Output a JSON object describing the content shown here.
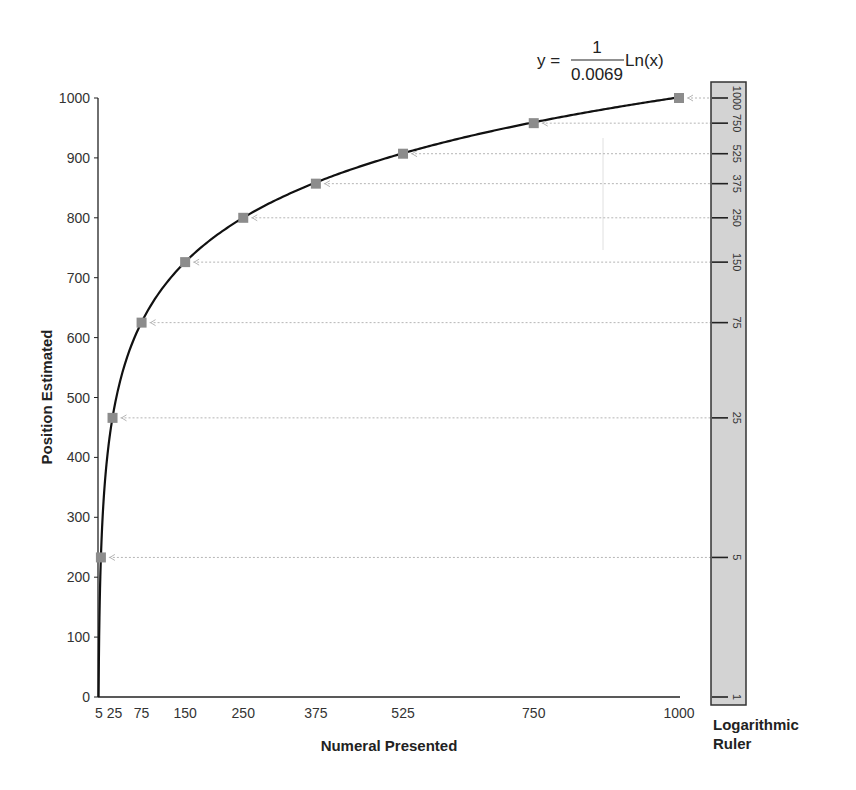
{
  "chart_data": {
    "type": "line",
    "title": "",
    "equation": {
      "lhs": "y =",
      "numerator": "1",
      "denominator": "0.0069",
      "rhs": "Ln(x)"
    },
    "xlabel": "Numeral Presented",
    "ylabel": "Position Estimated",
    "xlim": [
      0,
      1000
    ],
    "ylim": [
      0,
      1000
    ],
    "x_ticks": [
      5,
      25,
      75,
      150,
      250,
      375,
      525,
      750,
      1000
    ],
    "x_tick_labels": [
      "5",
      "25",
      "75",
      "150",
      "250",
      "375",
      "525",
      "750",
      "1000"
    ],
    "y_ticks": [
      0,
      100,
      200,
      300,
      400,
      500,
      600,
      700,
      800,
      900,
      1000
    ],
    "y_tick_labels": [
      "0",
      "100",
      "200",
      "300",
      "400",
      "500",
      "600",
      "700",
      "800",
      "900",
      "1000"
    ],
    "grid": false,
    "legend": null,
    "series": [
      {
        "name": "Logarithmic estimates",
        "marker": "square",
        "color": "#8c8c8c",
        "x": [
          5,
          25,
          75,
          150,
          250,
          375,
          525,
          750,
          1000
        ],
        "y": [
          233,
          466,
          625,
          726,
          800,
          857,
          907,
          958,
          1000
        ]
      }
    ],
    "curve": {
      "name": "y = Ln(x)/0.0069",
      "color": "#111111"
    },
    "ruler": {
      "title_line1": "Logarithmic",
      "title_line2": "Ruler",
      "marks": [
        "1000",
        "750",
        "525",
        "375",
        "250",
        "150",
        "75",
        "25",
        "5",
        "1"
      ],
      "fill": "#d3d3d3"
    }
  }
}
